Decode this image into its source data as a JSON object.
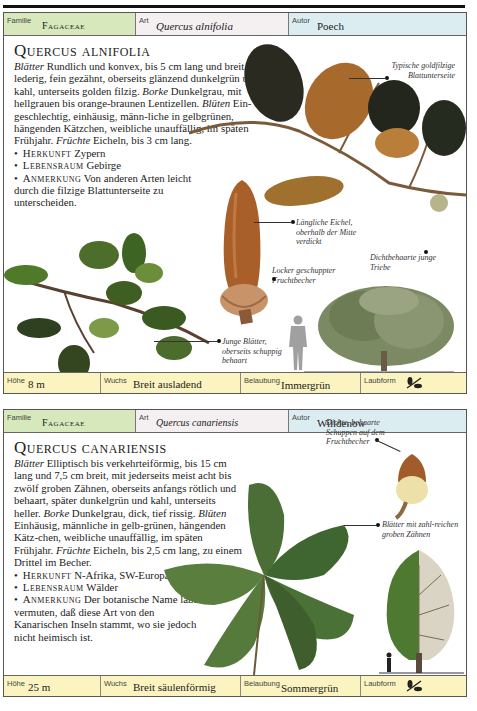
{
  "page": {
    "running_head": "EICHENARTEN"
  },
  "entries": [
    {
      "header": {
        "familie_label": "Familie",
        "familie": "Fagaceae",
        "art_label": "Art",
        "art": "Quercus alnifolia",
        "autor_label": "Autor",
        "autor": "Poech"
      },
      "title": "Quercus alnifolia",
      "description": {
        "blaetter_label": "Blätter",
        "blaetter": " Rundlich und konvex, bis 5 cm lang und breit, lederig, fein gezähnt, oberseits glänzend dunkelgrün und kahl, unterseits golden filzig.",
        "borke_label": "Borke",
        "borke": " Dunkelgrau, mit hellgrauen bis orange-braunen Lentizellen.",
        "blueten_label": "Blüten",
        "blueten": " Ein-geschlechtig, einhäusig, männ-liche in gelbgrünen, hängenden Kätzchen, weibliche unauffällig, im späten Frühjahr.",
        "fruechte_label": "Früchte",
        "fruechte": " Eicheln, bis 3 cm lang.",
        "herkunft_label": "Herkunft",
        "herkunft": " Zypern",
        "lebensraum_label": "Lebensraum",
        "lebensraum": " Gebirge",
        "anmerkung_label": "Anmerkung",
        "anmerkung": " Von anderen Arten leicht durch die filzige Blattunterseite zu unterscheiden."
      },
      "captions": [
        "Typische goldfilzige Blattunterseite",
        "Längliche Eichel, oberhalb der Mitte verdickt",
        "Dichtbehaarte junge Triebe",
        "Locker geschuppter Fruchtbecher",
        "Junge Blätter, oberseits schuppig behaart"
      ],
      "footer": {
        "hoehe_label": "Höhe",
        "hoehe": "8 m",
        "wuchs_label": "Wuchs",
        "wuchs": "Breit ausladend",
        "belaubung_label": "Belaubung",
        "belaubung": "Immergrün",
        "laubform_label": "Laubform",
        "laubform_icon": "leaf-sprig-icon"
      }
    },
    {
      "header": {
        "familie_label": "Familie",
        "familie": "Fagaceae",
        "art_label": "Art",
        "art": "Quercus canariensis",
        "autor_label": "Autor",
        "autor": "Willdenow"
      },
      "title": "Quercus canariensis",
      "description": {
        "blaetter_label": "Blätter",
        "blaetter": " Elliptisch bis verkehrteiförmig, bis 15 cm lang und 7,5 cm breit, mit jederseits meist acht bis zwölf groben Zähnen, oberseits anfangs rötlich und behaart, später dunkelgrün und kahl, unterseits heller.",
        "borke_label": "Borke",
        "borke": " Dunkelgrau, dick, tief rissig.",
        "blueten_label": "Blüten",
        "blueten": " Einhäusig, männliche in gelb-grünen, hängenden Kätz-chen, weibliche unauffällig, im späten Frühjahr.",
        "fruechte_label": "Früchte",
        "fruechte": " Eicheln, bis 2,5 cm lang, zu einem Drittel im Becher.",
        "herkunft_label": "Herkunft",
        "herkunft": " N-Afrika, SW-Europa",
        "lebensraum_label": "Lebensraum",
        "lebensraum": " Wälder",
        "anmerkung_label": "Anmerkung",
        "anmerkung": " Der botanische Name läßt vermuten, daß diese Art von den Kanarischen Inseln stammt, wo sie jedoch nicht heimisch ist."
      },
      "captions": [
        "Dichte, behaarte Schuppen auf dem Fruchtbecher",
        "Blätter mit zahl-reichen groben Zähnen"
      ],
      "footer": {
        "hoehe_label": "Höhe",
        "hoehe": "25 m",
        "wuchs_label": "Wuchs",
        "wuchs": "Breit säulenförmig",
        "belaubung_label": "Belaubung",
        "belaubung": "Sommergrün",
        "laubform_label": "Laubform",
        "laubform_icon": "leaf-sprig-icon"
      }
    }
  ],
  "colors": {
    "familie_bg": "#d8e8bd",
    "art_bg": "#f4eff1",
    "autor_bg": "#dcedf2",
    "footer_bg": "#fbf4c1"
  }
}
